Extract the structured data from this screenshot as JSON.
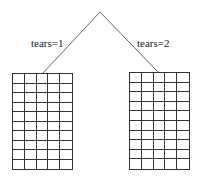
{
  "tree": {
    "root": {
      "x": 100,
      "y": 12
    },
    "branches": [
      {
        "label": "tears=1",
        "end": {
          "x": 43,
          "y": 73
        },
        "label_pos": {
          "x": 31,
          "y": 38
        }
      },
      {
        "label": "tears=2",
        "end": {
          "x": 158,
          "y": 72
        },
        "label_pos": {
          "x": 137,
          "y": 38
        }
      }
    ],
    "leaves": [
      {
        "x": 12,
        "y": 73,
        "width": 61,
        "height": 97,
        "cols": 5,
        "rows": 10
      },
      {
        "x": 129,
        "y": 72,
        "width": 61,
        "height": 98,
        "cols": 5,
        "rows": 10
      }
    ],
    "line_color": "#555555"
  }
}
